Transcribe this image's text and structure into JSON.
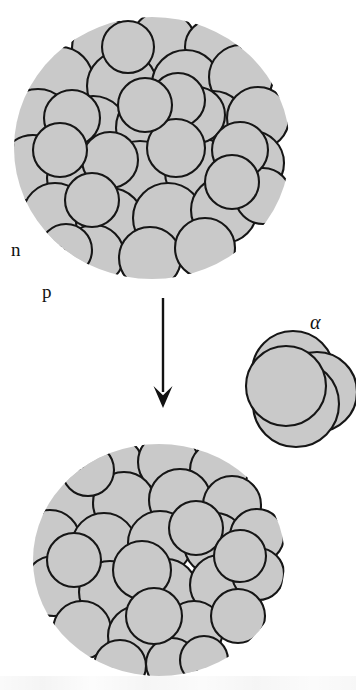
{
  "figure": {
    "background_color": "#ffffff",
    "nucleon_fill": "#c9c9c9",
    "nucleon_stroke": "#161616",
    "ink_color": "#121212"
  },
  "labels": {
    "neutron": "n",
    "proton": "p",
    "alpha": "α"
  },
  "parent_nucleus": {
    "name": "parent-nucleus",
    "center": [
      152,
      148
    ],
    "radius_x": 138,
    "radius_y": 131,
    "nucleon_count": 37,
    "nucleon_radius": 31,
    "nucleons": [
      [
        103,
        48,
        31
      ],
      [
        163,
        44,
        33
      ],
      [
        213,
        47,
        28
      ],
      [
        60,
        80,
        33
      ],
      [
        122,
        86,
        35
      ],
      [
        186,
        84,
        34
      ],
      [
        241,
        77,
        32
      ],
      [
        38,
        122,
        33
      ],
      [
        93,
        131,
        35
      ],
      [
        152,
        128,
        36
      ],
      [
        213,
        125,
        34
      ],
      [
        258,
        118,
        31
      ],
      [
        33,
        168,
        33
      ],
      [
        81,
        178,
        34
      ],
      [
        140,
        176,
        35
      ],
      [
        199,
        172,
        34
      ],
      [
        252,
        163,
        32
      ],
      [
        55,
        215,
        32
      ],
      [
        110,
        222,
        34
      ],
      [
        168,
        218,
        35
      ],
      [
        224,
        210,
        33
      ],
      [
        263,
        196,
        28
      ],
      [
        94,
        255,
        30
      ],
      [
        150,
        258,
        31
      ],
      [
        205,
        248,
        30
      ],
      [
        72,
        118,
        28
      ],
      [
        128,
        47,
        26
      ],
      [
        197,
        115,
        28
      ],
      [
        240,
        150,
        28
      ],
      [
        66,
        250,
        26
      ],
      [
        178,
        100,
        27
      ],
      [
        110,
        160,
        28
      ],
      [
        176,
        148,
        29
      ],
      [
        232,
        182,
        27
      ],
      [
        92,
        200,
        27
      ],
      [
        145,
        105,
        27
      ],
      [
        60,
        150,
        27
      ]
    ]
  },
  "daughter_nucleus": {
    "name": "daughter-nucleus",
    "center": [
      159,
      560
    ],
    "radius_x": 126,
    "radius_y": 116,
    "nucleon_count": 30,
    "nucleon_radius": 30,
    "nucleons": [
      [
        113,
        466,
        30
      ],
      [
        168,
        462,
        30
      ],
      [
        219,
        470,
        29
      ],
      [
        70,
        498,
        30
      ],
      [
        124,
        503,
        31
      ],
      [
        180,
        500,
        31
      ],
      [
        232,
        505,
        29
      ],
      [
        50,
        540,
        30
      ],
      [
        104,
        545,
        32
      ],
      [
        160,
        543,
        32
      ],
      [
        215,
        544,
        31
      ],
      [
        257,
        536,
        27
      ],
      [
        54,
        586,
        30
      ],
      [
        110,
        592,
        31
      ],
      [
        166,
        590,
        31
      ],
      [
        220,
        585,
        30
      ],
      [
        258,
        574,
        26
      ],
      [
        82,
        630,
        29
      ],
      [
        138,
        636,
        30
      ],
      [
        194,
        630,
        29
      ],
      [
        238,
        616,
        27
      ],
      [
        120,
        666,
        26
      ],
      [
        172,
        664,
        26
      ],
      [
        88,
        470,
        26
      ],
      [
        196,
        528,
        27
      ],
      [
        142,
        570,
        29
      ],
      [
        74,
        560,
        27
      ],
      [
        240,
        556,
        26
      ],
      [
        154,
        616,
        28
      ],
      [
        204,
        660,
        24
      ]
    ]
  },
  "alpha_particle": {
    "name": "alpha-particle",
    "center": [
      300,
      388
    ],
    "nucleon_count": 4,
    "nucleons": [
      [
        293,
        372,
        41
      ],
      [
        317,
        392,
        40
      ],
      [
        296,
        404,
        43
      ],
      [
        286,
        386,
        40
      ]
    ]
  },
  "arrows": [
    {
      "name": "decay-arrow-down",
      "style": "thin",
      "from": [
        163,
        298
      ],
      "to": [
        163,
        408
      ],
      "head_width": 19,
      "head_length": 22
    },
    {
      "name": "alpha-emission-arrow",
      "style": "thick",
      "from": [
        216,
        283
      ],
      "to": [
        262,
        330
      ],
      "head_width": 22,
      "head_length": 26
    }
  ],
  "leaders": [
    {
      "name": "neutron-leader",
      "label": "n",
      "from": [
        25,
        243
      ],
      "to": [
        45,
        201
      ],
      "head_angle_deg": -64
    },
    {
      "name": "proton-leader",
      "label": "p",
      "from": [
        55,
        283
      ],
      "to": [
        72,
        230
      ],
      "head_angle_deg": -72
    }
  ]
}
